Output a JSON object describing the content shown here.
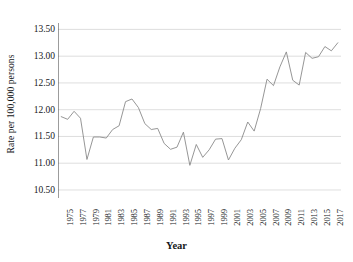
{
  "chart_data": {
    "type": "line",
    "title": "",
    "xlabel": "Year",
    "ylabel": "Rate per 100,000 persons",
    "ylim": [
      10.35,
      13.62
    ],
    "xlim": [
      1974.5,
      2018.5
    ],
    "grid": true,
    "legend": null,
    "yticks": [
      "13.50",
      "13.00",
      "12.50",
      "12.00",
      "11.50",
      "11.00",
      "10.50"
    ],
    "ytick_values": [
      13.5,
      13.0,
      12.5,
      12.0,
      11.5,
      11.0,
      10.5
    ],
    "xticks": [
      "1975",
      "1977",
      "1979",
      "1981",
      "1983",
      "1985",
      "1987",
      "1989",
      "1991",
      "1993",
      "1995",
      "1997",
      "1999",
      "2001",
      "2003",
      "2005",
      "2007",
      "2009",
      "2011",
      "2013",
      "2015",
      "2017"
    ],
    "xtick_values": [
      1975,
      1977,
      1979,
      1981,
      1983,
      1985,
      1987,
      1989,
      1991,
      1993,
      1995,
      1997,
      1999,
      2001,
      2003,
      2005,
      2007,
      2009,
      2011,
      2013,
      2015,
      2017
    ],
    "line_color": "#8a8a8a",
    "grid_color": "#d6d6d6",
    "axis_color": "#4a4a4a",
    "x": [
      1975,
      1976,
      1977,
      1978,
      1979,
      1980,
      1981,
      1982,
      1983,
      1984,
      1985,
      1986,
      1987,
      1988,
      1989,
      1990,
      1991,
      1992,
      1993,
      1994,
      1995,
      1996,
      1997,
      1998,
      1999,
      2000,
      2001,
      2002,
      2003,
      2004,
      2005,
      2006,
      2007,
      2008,
      2009,
      2010,
      2011,
      2012,
      2013,
      2014,
      2015,
      2016,
      2017,
      2018
    ],
    "values": [
      11.87,
      11.82,
      11.97,
      11.84,
      11.07,
      11.49,
      11.49,
      11.47,
      11.63,
      11.7,
      12.15,
      12.2,
      12.04,
      11.74,
      11.63,
      11.65,
      11.37,
      11.26,
      11.3,
      11.58,
      10.96,
      11.35,
      11.11,
      11.25,
      11.45,
      11.46,
      11.06,
      11.28,
      11.44,
      11.77,
      11.6,
      12.02,
      12.57,
      12.45,
      12.8,
      13.08,
      12.55,
      12.46,
      13.07,
      12.96,
      12.99,
      13.18,
      13.1,
      13.25
    ]
  }
}
